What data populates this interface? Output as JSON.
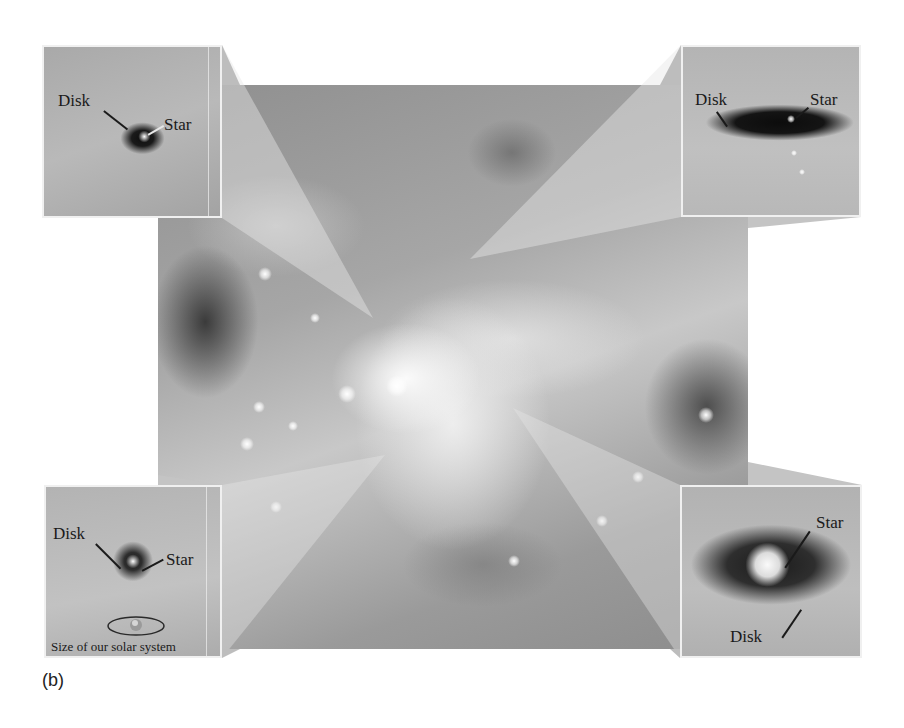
{
  "figure": {
    "label": "(b)"
  },
  "insets": [
    {
      "position": "top-left",
      "labels": [
        "Disk",
        "Star"
      ]
    },
    {
      "position": "top-right",
      "labels": [
        "Disk",
        "Star"
      ]
    },
    {
      "position": "bottom-left",
      "labels": [
        "Disk",
        "Star"
      ],
      "scale_caption": "Size of our solar system"
    },
    {
      "position": "bottom-right",
      "labels": [
        "Star",
        "Disk"
      ]
    }
  ],
  "colors": {
    "background": "#ffffff",
    "inset_border": "#f0f0f0",
    "label_text": "#1a1a1a"
  }
}
